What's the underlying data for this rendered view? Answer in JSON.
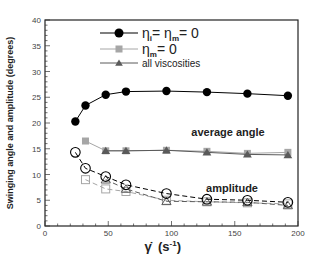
{
  "chart_data": {
    "type": "line",
    "title": "",
    "xlabel": "γ̇ (s⁻¹)",
    "ylabel": "Swinging angle and amplitude (degrees)",
    "xlim": [
      0,
      200
    ],
    "ylim": [
      0,
      40
    ],
    "xticks": [
      0,
      50,
      100,
      150,
      200
    ],
    "yticks": [
      0,
      5,
      10,
      15,
      20,
      25,
      30,
      35,
      40
    ],
    "grid": false,
    "legend_position": "upper center",
    "legend": [
      "ηi = ηm = 0",
      "ηm = 0",
      "all viscosities"
    ],
    "annotations": [
      "average angle",
      "amplitude"
    ],
    "series": [
      {
        "name": "ηi = ηm = 0 (average angle)",
        "marker": "filled-circle",
        "color": "#000000",
        "line": "solid",
        "x": [
          24,
          32,
          48,
          64,
          96,
          128,
          160,
          192
        ],
        "values": [
          20.3,
          23.4,
          25.5,
          26.1,
          26.2,
          26.0,
          25.7,
          25.3
        ]
      },
      {
        "name": "ηm = 0 (average angle)",
        "marker": "filled-square",
        "color": "#a6a6a6",
        "line": "solid",
        "x": [
          32,
          48,
          64,
          96,
          128,
          160,
          192
        ],
        "values": [
          16.5,
          14.6,
          14.6,
          14.7,
          14.5,
          14.1,
          14.3
        ]
      },
      {
        "name": "all viscosities (average angle)",
        "marker": "filled-triangle",
        "color": "#5a5a5a",
        "line": "solid",
        "x": [
          48,
          64,
          96,
          128,
          160,
          192
        ],
        "values": [
          14.6,
          14.6,
          14.7,
          14.3,
          13.9,
          13.8
        ]
      },
      {
        "name": "ηi = ηm = 0 (amplitude)",
        "marker": "open-circle",
        "color": "#000000",
        "line": "dashed",
        "x": [
          24,
          32,
          48,
          64,
          96,
          128,
          160,
          192
        ],
        "values": [
          14.3,
          11.2,
          9.6,
          8.0,
          6.3,
          5.2,
          5.0,
          4.6
        ]
      },
      {
        "name": "ηm = 0 (amplitude)",
        "marker": "open-square",
        "color": "#a6a6a6",
        "line": "dashed",
        "x": [
          32,
          48,
          64,
          96,
          128,
          160,
          192
        ],
        "values": [
          9.0,
          7.2,
          6.7,
          5.0,
          4.7,
          4.5,
          4.3
        ]
      },
      {
        "name": "all viscosities (amplitude)",
        "marker": "open-triangle",
        "color": "#5a5a5a",
        "line": "dashed",
        "x": [
          48,
          64,
          96,
          128,
          160,
          192
        ],
        "values": [
          9.0,
          7.2,
          4.8,
          4.7,
          4.6,
          4.0
        ]
      }
    ]
  },
  "labels": {
    "ylabel": "Swinging angle and amplitude (degrees)",
    "xlabel_symbol": "γ̇",
    "xlabel_unit": "(s",
    "xlabel_exp": "-1",
    "xlabel_close": ")",
    "annot_average": "average angle",
    "annot_amplitude": "amplitude",
    "legend": [
      {
        "eta1": "η",
        "sub1": "i",
        "eq1": "= ",
        "eta2": "η",
        "sub2": "m",
        "eq2": "= 0"
      },
      {
        "eta1": "η",
        "sub1": "m",
        "eq1": "= 0"
      },
      {
        "text": "all viscosities"
      }
    ]
  }
}
